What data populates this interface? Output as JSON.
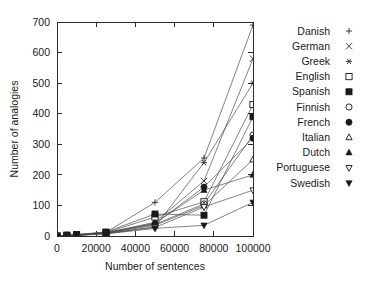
{
  "chart_data": {
    "type": "line",
    "title": "",
    "xlabel": "Number of sentences",
    "ylabel": "Number of analogies",
    "xlim": [
      0,
      100000
    ],
    "ylim": [
      0,
      700
    ],
    "xticks": [
      0,
      20000,
      40000,
      60000,
      80000,
      100000
    ],
    "yticks": [
      0,
      100,
      200,
      300,
      400,
      500,
      600,
      700
    ],
    "xtick_labels": [
      "0",
      "20000",
      "40000",
      "60000",
      "80000",
      "100000"
    ],
    "ytick_labels": [
      "0",
      "100",
      "200",
      "300",
      "400",
      "500",
      "600",
      "700"
    ],
    "grid": false,
    "legend_position": "right",
    "x": [
      0,
      5000,
      10000,
      25000,
      50000,
      75000,
      100000
    ],
    "series": [
      {
        "name": "Danish",
        "marker": "plus",
        "values": [
          0,
          2,
          4,
          12,
          110,
          255,
          690
        ]
      },
      {
        "name": "German",
        "marker": "cross",
        "values": [
          0,
          2,
          3,
          10,
          45,
          180,
          580
        ]
      },
      {
        "name": "Greek",
        "marker": "asterisk",
        "values": [
          0,
          1,
          2,
          8,
          30,
          240,
          500
        ]
      },
      {
        "name": "English",
        "marker": "square-open",
        "values": [
          0,
          2,
          4,
          11,
          62,
          112,
          430
        ]
      },
      {
        "name": "Spanish",
        "marker": "square-filled",
        "values": [
          0,
          3,
          5,
          13,
          72,
          68,
          390
        ]
      },
      {
        "name": "Finnish",
        "marker": "circle-open",
        "values": [
          0,
          1,
          2,
          9,
          38,
          105,
          330
        ]
      },
      {
        "name": "French",
        "marker": "circle-filled",
        "values": [
          0,
          2,
          4,
          12,
          40,
          160,
          320
        ]
      },
      {
        "name": "Italian",
        "marker": "tri-up-open",
        "values": [
          0,
          1,
          3,
          9,
          35,
          100,
          250
        ]
      },
      {
        "name": "Dutch",
        "marker": "tri-up-filled",
        "values": [
          0,
          2,
          3,
          10,
          42,
          150,
          200
        ]
      },
      {
        "name": "Portuguese",
        "marker": "tri-dn-open",
        "values": [
          0,
          1,
          2,
          8,
          28,
          95,
          150
        ]
      },
      {
        "name": "Swedish",
        "marker": "tri-dn-filled",
        "values": [
          0,
          1,
          2,
          7,
          25,
          35,
          110
        ]
      }
    ],
    "legend_entries": [
      {
        "label": "Danish",
        "marker": "plus"
      },
      {
        "label": "German",
        "marker": "cross"
      },
      {
        "label": "Greek",
        "marker": "asterisk"
      },
      {
        "label": "English",
        "marker": "square-open"
      },
      {
        "label": "Spanish",
        "marker": "square-filled"
      },
      {
        "label": "Finnish",
        "marker": "circle-open"
      },
      {
        "label": "French",
        "marker": "circle-filled"
      },
      {
        "label": "Italian",
        "marker": "tri-up-open"
      },
      {
        "label": "Dutch",
        "marker": "tri-up-filled"
      },
      {
        "label": "Portuguese",
        "marker": "tri-dn-open"
      },
      {
        "label": "Swedish",
        "marker": "tri-dn-filled"
      }
    ],
    "colors": {
      "line": "#4d4d4d",
      "axis": "#2b2b2b",
      "text": "#1a1a1a",
      "background": "#ffffff"
    }
  }
}
